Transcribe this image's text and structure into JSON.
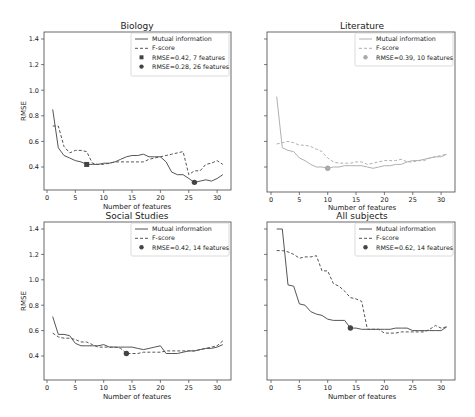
{
  "figure": {
    "width": 475,
    "height": 417,
    "colors": {
      "axis": "#444444",
      "mi_dark": "#555555",
      "fs_dark": "#555555",
      "mi_light": "#b0b0b0",
      "fs_light": "#b0b0b0",
      "marker_dark": "#444444",
      "marker_light": "#aaaaaa"
    }
  },
  "chart_data": [
    {
      "type": "line",
      "title": "Biology",
      "xlabel": "Number of features",
      "ylabel": "RMSE",
      "xlim": [
        -0.5,
        32
      ],
      "ylim": [
        0.23,
        1.45
      ],
      "xticks": [
        0,
        5,
        10,
        15,
        20,
        25,
        30
      ],
      "yticks": [
        0.4,
        0.6,
        0.8,
        1.0,
        1.2,
        1.4
      ],
      "show_yticklabels": true,
      "grid": false,
      "legend_position": "upper right",
      "series": [
        {
          "name": "Mutual information",
          "style": "solid",
          "color_key": "mi_dark",
          "x": [
            1,
            2,
            3,
            4,
            5,
            6,
            7,
            8,
            9,
            10,
            11,
            12,
            13,
            14,
            15,
            16,
            17,
            18,
            19,
            20,
            21,
            22,
            23,
            24,
            25,
            26,
            27,
            28,
            29,
            30,
            31
          ],
          "y": [
            0.85,
            0.55,
            0.49,
            0.47,
            0.45,
            0.44,
            0.42,
            0.42,
            0.42,
            0.43,
            0.43,
            0.44,
            0.46,
            0.48,
            0.49,
            0.49,
            0.5,
            0.48,
            0.48,
            0.48,
            0.44,
            0.36,
            0.34,
            0.34,
            0.31,
            0.28,
            0.29,
            0.3,
            0.29,
            0.31,
            0.34
          ]
        },
        {
          "name": "F-score",
          "style": "dashed",
          "color_key": "fs_dark",
          "x": [
            1,
            2,
            3,
            4,
            5,
            6,
            7,
            8,
            9,
            10,
            11,
            12,
            13,
            14,
            15,
            16,
            17,
            18,
            19,
            20,
            21,
            22,
            23,
            24,
            25,
            26,
            27,
            28,
            29,
            30,
            31
          ],
          "y": [
            0.72,
            0.72,
            0.56,
            0.51,
            0.53,
            0.53,
            0.52,
            0.43,
            0.42,
            0.42,
            0.43,
            0.44,
            0.44,
            0.44,
            0.44,
            0.44,
            0.44,
            0.46,
            0.47,
            0.48,
            0.49,
            0.5,
            0.51,
            0.52,
            0.34,
            0.37,
            0.37,
            0.42,
            0.43,
            0.45,
            0.42
          ]
        }
      ],
      "markers": [
        {
          "label": "RMSE=0.42, 7 features",
          "x": 7,
          "y": 0.42,
          "shape": "square",
          "color_key": "marker_dark"
        },
        {
          "label": "RMSE=0.28, 26 features",
          "x": 26,
          "y": 0.28,
          "shape": "circle",
          "color_key": "marker_dark"
        }
      ],
      "legend": [
        "Mutual information",
        "F-score",
        "RMSE=0.42, 7 features",
        "RMSE=0.28, 26 features"
      ]
    },
    {
      "type": "line",
      "title": "Literature",
      "xlabel": "Number of features",
      "ylabel": "",
      "xlim": [
        -0.5,
        32
      ],
      "ylim": [
        0.23,
        1.45
      ],
      "xticks": [
        0,
        5,
        10,
        15,
        20,
        25,
        30
      ],
      "yticks": [
        0.4,
        0.6,
        0.8,
        1.0,
        1.2,
        1.4
      ],
      "show_yticklabels": false,
      "grid": false,
      "legend_position": "upper right",
      "series": [
        {
          "name": "Mutual information",
          "style": "solid",
          "color_key": "mi_light",
          "x": [
            1,
            2,
            3,
            4,
            5,
            6,
            7,
            8,
            9,
            10,
            11,
            12,
            13,
            14,
            15,
            16,
            17,
            18,
            19,
            20,
            21,
            22,
            23,
            24,
            25,
            26,
            27,
            28,
            29,
            30,
            31
          ],
          "y": [
            0.95,
            0.55,
            0.53,
            0.52,
            0.47,
            0.45,
            0.42,
            0.4,
            0.4,
            0.39,
            0.4,
            0.4,
            0.41,
            0.41,
            0.41,
            0.41,
            0.4,
            0.39,
            0.4,
            0.41,
            0.41,
            0.42,
            0.42,
            0.44,
            0.45,
            0.45,
            0.46,
            0.47,
            0.48,
            0.48,
            0.5
          ]
        },
        {
          "name": "F-score",
          "style": "dashed",
          "color_key": "fs_light",
          "x": [
            1,
            2,
            3,
            4,
            5,
            6,
            7,
            8,
            9,
            10,
            11,
            12,
            13,
            14,
            15,
            16,
            17,
            18,
            19,
            20,
            21,
            22,
            23,
            24,
            25,
            26,
            27,
            28,
            29,
            30,
            31
          ],
          "y": [
            0.58,
            0.59,
            0.6,
            0.59,
            0.57,
            0.57,
            0.56,
            0.54,
            0.52,
            0.47,
            0.44,
            0.43,
            0.43,
            0.43,
            0.44,
            0.44,
            0.42,
            0.43,
            0.44,
            0.45,
            0.45,
            0.45,
            0.46,
            0.44,
            0.44,
            0.45,
            0.45,
            0.47,
            0.48,
            0.49,
            0.5
          ]
        }
      ],
      "markers": [
        {
          "label": "RMSE=0.39, 10 features",
          "x": 10,
          "y": 0.39,
          "shape": "circle",
          "color_key": "marker_light"
        }
      ],
      "legend": [
        "Mutual information",
        "F-score",
        "RMSE=0.39, 10 features"
      ]
    },
    {
      "type": "line",
      "title": "Social Studies",
      "xlabel": "Number of features",
      "ylabel": "RMSE",
      "xlim": [
        -0.5,
        32
      ],
      "ylim": [
        0.23,
        1.45
      ],
      "xticks": [
        0,
        5,
        10,
        15,
        20,
        25,
        30
      ],
      "yticks": [
        0.4,
        0.6,
        0.8,
        1.0,
        1.2,
        1.4
      ],
      "show_yticklabels": true,
      "grid": false,
      "legend_position": "upper right",
      "series": [
        {
          "name": "Mutual information",
          "style": "solid",
          "color_key": "mi_dark",
          "x": [
            1,
            2,
            3,
            4,
            5,
            6,
            7,
            8,
            9,
            10,
            11,
            12,
            13,
            14,
            15,
            16,
            17,
            18,
            19,
            20,
            21,
            22,
            23,
            24,
            25,
            26,
            27,
            28,
            29,
            30,
            31
          ],
          "y": [
            0.71,
            0.57,
            0.57,
            0.56,
            0.5,
            0.48,
            0.48,
            0.48,
            0.48,
            0.49,
            0.47,
            0.47,
            0.47,
            0.47,
            0.47,
            0.46,
            0.45,
            0.46,
            0.47,
            0.48,
            0.42,
            0.42,
            0.42,
            0.43,
            0.44,
            0.44,
            0.45,
            0.46,
            0.46,
            0.47,
            0.49
          ]
        },
        {
          "name": "F-score",
          "style": "dashed",
          "color_key": "fs_dark",
          "x": [
            1,
            2,
            3,
            4,
            5,
            6,
            7,
            8,
            9,
            10,
            11,
            12,
            13,
            14,
            15,
            16,
            17,
            18,
            19,
            20,
            21,
            22,
            23,
            24,
            25,
            26,
            27,
            28,
            29,
            30,
            31
          ],
          "y": [
            0.58,
            0.55,
            0.54,
            0.54,
            0.53,
            0.51,
            0.51,
            0.49,
            0.47,
            0.47,
            0.47,
            0.47,
            0.46,
            0.42,
            0.42,
            0.42,
            0.43,
            0.43,
            0.43,
            0.43,
            0.44,
            0.44,
            0.44,
            0.44,
            0.44,
            0.44,
            0.45,
            0.46,
            0.47,
            0.48,
            0.52
          ]
        }
      ],
      "markers": [
        {
          "label": "RMSE=0.42, 14 features",
          "x": 14,
          "y": 0.42,
          "shape": "circle",
          "color_key": "marker_dark"
        }
      ],
      "legend": [
        "Mutual information",
        "F-score",
        "RMSE=0.42, 14 features"
      ]
    },
    {
      "type": "line",
      "title": "All subjects",
      "xlabel": "Number of features",
      "ylabel": "",
      "xlim": [
        -0.5,
        32
      ],
      "ylim": [
        0.23,
        1.45
      ],
      "xticks": [
        0,
        5,
        10,
        15,
        20,
        25,
        30
      ],
      "yticks": [
        0.4,
        0.6,
        0.8,
        1.0,
        1.2,
        1.4
      ],
      "show_yticklabels": false,
      "grid": false,
      "legend_position": "upper right",
      "series": [
        {
          "name": "Mutual information",
          "style": "solid",
          "color_key": "mi_dark",
          "x": [
            1,
            2,
            3,
            4,
            5,
            6,
            7,
            8,
            9,
            10,
            11,
            12,
            13,
            14,
            15,
            16,
            17,
            18,
            19,
            20,
            21,
            22,
            23,
            24,
            25,
            26,
            27,
            28,
            29,
            30,
            31
          ],
          "y": [
            1.4,
            1.4,
            0.96,
            0.95,
            0.81,
            0.8,
            0.75,
            0.73,
            0.72,
            0.69,
            0.68,
            0.68,
            0.68,
            0.62,
            0.62,
            0.61,
            0.61,
            0.61,
            0.61,
            0.61,
            0.61,
            0.62,
            0.62,
            0.62,
            0.6,
            0.6,
            0.6,
            0.6,
            0.6,
            0.6,
            0.63
          ]
        },
        {
          "name": "F-score",
          "style": "dashed",
          "color_key": "fs_dark",
          "x": [
            1,
            2,
            3,
            4,
            5,
            6,
            7,
            8,
            9,
            10,
            11,
            12,
            13,
            14,
            15,
            16,
            17,
            18,
            19,
            20,
            21,
            22,
            23,
            24,
            25,
            26,
            27,
            28,
            29,
            30,
            31
          ],
          "y": [
            1.23,
            1.23,
            1.22,
            1.2,
            1.17,
            1.18,
            1.18,
            1.19,
            1.07,
            1.07,
            0.97,
            0.95,
            0.91,
            0.86,
            0.85,
            0.83,
            0.61,
            0.61,
            0.61,
            0.58,
            0.58,
            0.58,
            0.59,
            0.59,
            0.59,
            0.59,
            0.59,
            0.61,
            0.64,
            0.62,
            0.63
          ]
        }
      ],
      "markers": [
        {
          "label": "RMSE=0.62, 14 features",
          "x": 14,
          "y": 0.62,
          "shape": "circle",
          "color_key": "marker_dark"
        }
      ],
      "legend": [
        "Mutual information",
        "F-score",
        "RMSE=0.62, 14 features"
      ]
    }
  ],
  "panels": [
    {
      "left": 44,
      "top": 32,
      "right": 231,
      "bottom": 190,
      "x0px": 47,
      "pxPerX": 5.67,
      "y04px": 167,
      "pxPer01": 12.8,
      "legend": {
        "x": 131,
        "y": 33,
        "w": 98,
        "h": 43
      }
    },
    {
      "left": 267,
      "top": 32,
      "right": 455,
      "bottom": 192,
      "x0px": 271,
      "pxPerX": 5.67,
      "y04px": 167,
      "pxPer01": 12.8,
      "legend": {
        "x": 355,
        "y": 33,
        "w": 98,
        "h": 33
      }
    },
    {
      "left": 44,
      "top": 222,
      "right": 231,
      "bottom": 380,
      "x0px": 47,
      "pxPerX": 5.67,
      "y04px": 356,
      "pxPer01": 12.7,
      "legend": {
        "x": 131,
        "y": 223,
        "w": 98,
        "h": 33
      }
    },
    {
      "left": 267,
      "top": 222,
      "right": 455,
      "bottom": 380,
      "x0px": 271,
      "pxPerX": 5.67,
      "y04px": 356,
      "pxPer01": 12.7,
      "legend": {
        "x": 355,
        "y": 223,
        "w": 98,
        "h": 33
      }
    }
  ]
}
